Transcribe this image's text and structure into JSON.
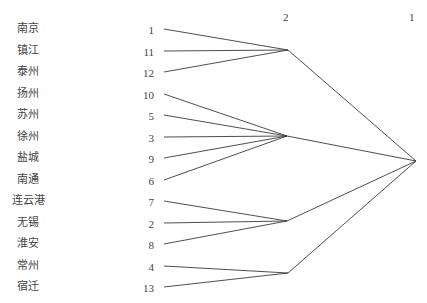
{
  "diagram": {
    "type": "dendrogram",
    "levels": [
      {
        "label": "2",
        "x": 286
      },
      {
        "label": "1",
        "x": 411
      }
    ],
    "rows": [
      {
        "city": "南京",
        "id": "1",
        "cluster": "A"
      },
      {
        "city": "镇江",
        "id": "11",
        "cluster": "A"
      },
      {
        "city": "泰州",
        "id": "12",
        "cluster": "A"
      },
      {
        "city": "扬州",
        "id": "10",
        "cluster": "B"
      },
      {
        "city": "苏州",
        "id": "5",
        "cluster": "B"
      },
      {
        "city": "徐州",
        "id": "3",
        "cluster": "B"
      },
      {
        "city": "盐城",
        "id": "9",
        "cluster": "B"
      },
      {
        "city": "南通",
        "id": "6",
        "cluster": "B"
      },
      {
        "city": "连云港",
        "id": "7",
        "cluster": "C"
      },
      {
        "city": "无锡",
        "id": "2",
        "cluster": "C"
      },
      {
        "city": "淮安",
        "id": "8",
        "cluster": "C"
      },
      {
        "city": "常州",
        "id": "4",
        "cluster": "D"
      },
      {
        "city": "宿迁",
        "id": "13",
        "cluster": "D"
      }
    ],
    "clusters": [
      {
        "name": "A",
        "members": [
          "1",
          "11",
          "12"
        ],
        "node": [
          288,
          50
        ]
      },
      {
        "name": "B",
        "members": [
          "10",
          "5",
          "3",
          "9",
          "6"
        ],
        "node": [
          287,
          136
        ]
      },
      {
        "name": "C",
        "members": [
          "7",
          "2",
          "8"
        ],
        "node": [
          287,
          221
        ]
      },
      {
        "name": "D",
        "members": [
          "4",
          "13"
        ],
        "node": [
          288,
          273
        ]
      }
    ],
    "root": {
      "node": [
        416,
        161
      ]
    }
  }
}
